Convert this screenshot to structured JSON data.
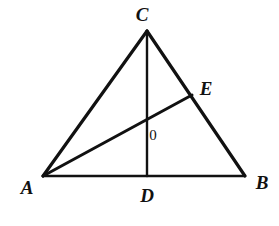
{
  "figure": {
    "kind": "euclidean-triangle-diagram",
    "background_color": "#ffffff",
    "stroke_color": "#111111",
    "canvas": {
      "width": 279,
      "height": 226
    },
    "labels": {
      "apex": "C",
      "left_base": "A",
      "right_base": "B",
      "altitude_foot": "D",
      "point_on_cb": "E",
      "intersection": "0"
    },
    "label_positions": {
      "apex": {
        "x": 142,
        "y": 14
      },
      "left_base": {
        "x": 27,
        "y": 187
      },
      "right_base": {
        "x": 262,
        "y": 182
      },
      "altitude_foot": {
        "x": 147,
        "y": 195
      },
      "point_on_cb": {
        "x": 206,
        "y": 88
      },
      "intersection": {
        "x": 153,
        "y": 135
      }
    },
    "points": {
      "C": {
        "x": 147,
        "y": 31
      },
      "A": {
        "x": 43,
        "y": 176
      },
      "B": {
        "x": 245,
        "y": 176
      },
      "D": {
        "x": 147,
        "y": 176
      },
      "E": {
        "x": 192,
        "y": 95
      },
      "O": {
        "x": 147,
        "y": 123
      }
    },
    "segments": [
      {
        "name": "side-AC",
        "from": "A",
        "to": "C",
        "width": 3.2
      },
      {
        "name": "side-CB",
        "from": "C",
        "to": "B",
        "width": 3.2
      },
      {
        "name": "side-AB",
        "from": "A",
        "to": "B",
        "width": 2.6
      },
      {
        "name": "cevian-CD",
        "from": "C",
        "to": "D",
        "width": 2.4
      },
      {
        "name": "cevian-AE",
        "from": "A",
        "to": "E",
        "width": 3.0
      }
    ]
  }
}
